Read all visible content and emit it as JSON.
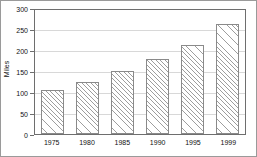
{
  "chart_data": {
    "type": "bar",
    "title": "",
    "subtitle": "",
    "xlabel": "",
    "ylabel": "Miles",
    "categories": [
      "1975",
      "1980",
      "1985",
      "1990",
      "1995",
      "1999"
    ],
    "values": [
      104,
      125,
      150,
      178,
      212,
      261
    ],
    "series": [
      {
        "name": "Miles",
        "values": [
          104,
          125,
          150,
          178,
          212,
          261
        ]
      }
    ],
    "ylim": [
      0,
      300
    ],
    "y_ticks": [
      0,
      50,
      100,
      150,
      200,
      250,
      300
    ],
    "y_tick_labels": [
      "0",
      "50",
      "100",
      "150",
      "200",
      "250",
      "300"
    ],
    "x_tick_labels": [
      "1975",
      "1980",
      "1985",
      "1990",
      "1995",
      "1999"
    ],
    "grid": "horizontal",
    "legend": "none",
    "bar_fill": "diagonal-hatch",
    "colors": {
      "bar_edge": "#8a8a8a",
      "bar_hatch": "#9d9d9d",
      "bar_face": "#ffffff",
      "gridline": "#d8d8d8",
      "axis": "#6e6e6e",
      "text": "#111111",
      "background": "#ffffff",
      "outer_border": "#9a9a9a"
    }
  }
}
